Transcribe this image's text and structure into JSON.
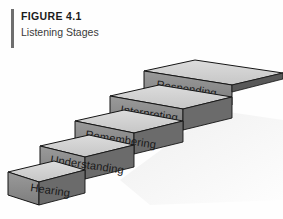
{
  "figure": {
    "label": "FIGURE 4.1",
    "title": "Listening Stages"
  },
  "colors": {
    "background": "#fefefe",
    "rule": "#6e6e6e",
    "tread_top": "#cdcdcd",
    "tread_top_light": "#dadada",
    "riser_front": "#8e8e8e",
    "riser_dark": "#6a6a6a",
    "side_dark": "#4a4a4a",
    "outline": "#151515",
    "label_text": "#1a1a1a",
    "shadow": "#ededed"
  },
  "diagram": {
    "type": "staircase",
    "name": "listening-stages-staircase",
    "direction": "ascending-left-to-right",
    "step_count": 5,
    "steps": [
      {
        "order": 1,
        "label": "Hearing"
      },
      {
        "order": 2,
        "label": "Understanding"
      },
      {
        "order": 3,
        "label": "Remembering"
      },
      {
        "order": 4,
        "label": "Interpreting"
      },
      {
        "order": 5,
        "label": "Responding"
      }
    ]
  }
}
